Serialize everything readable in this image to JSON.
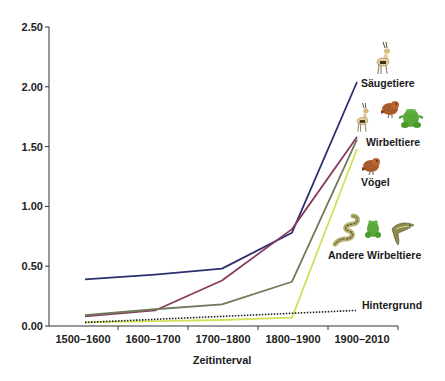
{
  "chart_data": {
    "type": "line",
    "title": "",
    "xlabel": "Zeitinterval",
    "ylabel": "",
    "categories": [
      "1500–1600",
      "1600–1700",
      "1700–1800",
      "1800–1900",
      "1900–2010"
    ],
    "ylim": [
      0,
      2.5
    ],
    "yticks": [
      "0.00",
      "0.50",
      "1.00",
      "1.50",
      "2.00",
      "2.50"
    ],
    "grid": false,
    "legend": "inline labels on right side with animal icons",
    "series": [
      {
        "name": "Säugetiere",
        "color": "#2b2f6e",
        "style": "solid",
        "values": [
          0.39,
          0.43,
          0.48,
          0.78,
          2.04
        ]
      },
      {
        "name": "Wirbeltiere",
        "color": "#8a3a5e",
        "style": "solid",
        "values": [
          0.08,
          0.13,
          0.38,
          0.81,
          1.58
        ]
      },
      {
        "name": "Vögel",
        "color": "#6e7a5a",
        "style": "solid",
        "values": [
          0.09,
          0.14,
          0.18,
          0.37,
          1.56
        ]
      },
      {
        "name": "Andere Wirbeltiere",
        "color": "#d4e05a",
        "style": "solid",
        "values": [
          0.03,
          0.04,
          0.05,
          0.07,
          1.48
        ]
      },
      {
        "name": "Hintergrund",
        "color": "#222222",
        "style": "dotted",
        "values": [
          0.03,
          0.05,
          0.07,
          0.1,
          0.13
        ]
      }
    ]
  },
  "labels": {
    "saeugetiere": "Säugetiere",
    "wirbeltiere": "Wirbeltiere",
    "voegel": "Vögel",
    "andere": "Andere Wirbeltiere",
    "hintergrund": "Hintergrund",
    "xaxis_title": "Zeitinterval"
  },
  "icons": {
    "saeugetiere": [
      "gazelle-icon"
    ],
    "wirbeltiere": [
      "gazelle-icon",
      "bird-icon",
      "frog-icon"
    ],
    "voegel": [
      "bird-icon"
    ],
    "andere": [
      "snake-icon",
      "frog-icon",
      "fish-icon"
    ]
  }
}
